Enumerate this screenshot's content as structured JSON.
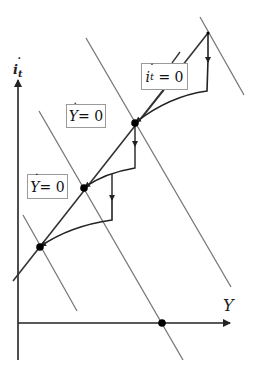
{
  "diagram": {
    "y_axis": {
      "symbol": "i",
      "subscript": "t"
    },
    "x_axis": {
      "symbol": "Y"
    },
    "labels": {
      "it_zero": {
        "symbol": "i",
        "subscript": "t",
        "rhs": "= 0"
      },
      "y_zero_upper": {
        "symbol": "Y",
        "rhs": "= 0"
      },
      "y_zero_lower": {
        "symbol": "Y",
        "rhs": "= 0"
      }
    },
    "colors": {
      "axis": "#222222",
      "locus": "#333333",
      "isoline": "#777777",
      "path": "#222222",
      "point": "#000000"
    }
  }
}
